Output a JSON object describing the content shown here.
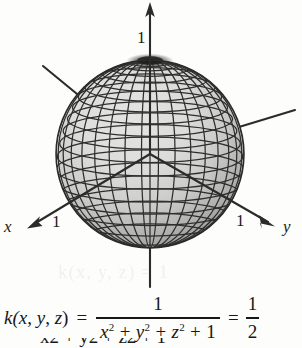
{
  "figure": {
    "surface_type": "sphere",
    "axes": [
      {
        "name": "x",
        "label": "x",
        "tick_label": "1",
        "direction": "front-left-down"
      },
      {
        "name": "y",
        "label": "y",
        "tick_label": "1",
        "direction": "front-right-down"
      },
      {
        "name": "z",
        "label": "",
        "tick_label": "1",
        "direction": "up"
      }
    ],
    "ghost_text": "k(x, y, z) = 1",
    "colors": {
      "mesh_line": "#2a2a2a",
      "surface_light": "#d9d9d9",
      "surface_dark": "#8a8a8a",
      "axis_line": "#2b2b2b",
      "text": "#171717",
      "background": "#fdfdfc"
    },
    "mesh": {
      "meridians": 24,
      "parallels": 17
    }
  },
  "equation": {
    "lhs": "k(",
    "lhs_var1": "x",
    "lhs_comma1": ", ",
    "lhs_var2": "y",
    "lhs_comma2": ", ",
    "lhs_var3": "z",
    "lhs_close": ")",
    "equals_1": "=",
    "numerator": "1",
    "denominator_terms": [
      "x",
      "2",
      "+",
      "y",
      "2",
      "+",
      "z",
      "2",
      "+",
      "1"
    ],
    "equals_2": "=",
    "result_numerator": "1",
    "result_denominator": "2",
    "plain_text": "k(x, y, z) = 1 / (x^2 + y^2 + z^2 + 1) = 1/2"
  },
  "next_line": {
    "visible_fragment": "x2 + y2 + z2 + 1"
  }
}
